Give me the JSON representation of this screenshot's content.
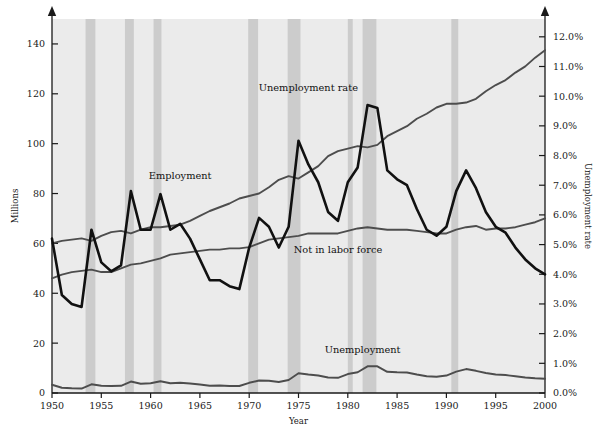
{
  "figure": {
    "xlabel": "Year",
    "ylabel_left": "Millions",
    "ylabel_right": "Unemployment rate",
    "bottom_clipped_text": ""
  },
  "series_labels": {
    "employment": "Employment",
    "not_in_labor_force": "Not in labor force",
    "unemployment": "Unemployment",
    "unemployment_rate": "Unemployment rate"
  },
  "colors": {
    "plot_background": "#ebebeb",
    "recession_band": "#cccccc",
    "axis": "#1a1a1a",
    "gray_line": "#4d4d4d",
    "black_line": "#111111",
    "page_background": "#ffffff"
  },
  "axes": {
    "x_ticks": [
      "1950",
      "1955",
      "1960",
      "1965",
      "1970",
      "1975",
      "1980",
      "1985",
      "1990",
      "1995",
      "2000"
    ],
    "y_left_ticks": [
      "0",
      "20",
      "40",
      "60",
      "80",
      "100",
      "120",
      "140"
    ],
    "y_right_ticks": [
      "0.0%",
      "1.0%",
      "2.0%",
      "3.0%",
      "4.0%",
      "5.0%",
      "6.0%",
      "7.0%",
      "8.0%",
      "9.0%",
      "10.0%",
      "11.0%",
      "12.0%"
    ]
  },
  "chart_data": {
    "type": "line",
    "title": "",
    "xlabel": "Year",
    "ylabel": "Millions",
    "ylabel_secondary": "Unemployment rate",
    "xlim": [
      1950,
      2000
    ],
    "ylim": [
      0,
      150
    ],
    "ylim_secondary": [
      0,
      12.6
    ],
    "grid": false,
    "legend": "inline-labels",
    "x": [
      1950,
      1951,
      1952,
      1953,
      1954,
      1955,
      1956,
      1957,
      1958,
      1959,
      1960,
      1961,
      1962,
      1963,
      1964,
      1965,
      1966,
      1967,
      1968,
      1969,
      1970,
      1971,
      1972,
      1973,
      1974,
      1975,
      1976,
      1977,
      1978,
      1979,
      1980,
      1981,
      1982,
      1983,
      1984,
      1985,
      1986,
      1987,
      1988,
      1989,
      1990,
      1991,
      1992,
      1993,
      1994,
      1995,
      1996,
      1997,
      1998,
      1999,
      2000
    ],
    "series": [
      {
        "name": "Employment",
        "axis": "left",
        "unit": "millions",
        "color": "#4d4d4d",
        "values": [
          60.0,
          61.0,
          61.5,
          62.0,
          61.0,
          63.0,
          64.5,
          65.0,
          64.0,
          65.5,
          66.5,
          66.5,
          67.0,
          67.5,
          69.0,
          71.0,
          73.0,
          74.5,
          76.0,
          78.0,
          79.0,
          80.0,
          82.5,
          85.5,
          87.0,
          86.0,
          88.5,
          91.0,
          95.0,
          97.0,
          98.0,
          99.0,
          98.5,
          99.5,
          103.0,
          105.0,
          107.0,
          110.0,
          112.0,
          114.5,
          116.0,
          116.0,
          116.5,
          118.0,
          121.0,
          123.5,
          125.5,
          128.5,
          131.0,
          134.5,
          137.5
        ]
      },
      {
        "name": "Not in labor force",
        "axis": "left",
        "unit": "millions",
        "color": "#4d4d4d",
        "values": [
          46.0,
          47.5,
          48.5,
          49.0,
          49.5,
          48.5,
          48.5,
          50.0,
          51.5,
          52.0,
          53.0,
          54.0,
          55.5,
          56.0,
          56.5,
          57.0,
          57.5,
          57.5,
          58.0,
          58.0,
          58.5,
          60.0,
          61.5,
          62.0,
          62.5,
          63.0,
          64.0,
          64.0,
          64.0,
          64.0,
          65.0,
          66.0,
          66.5,
          66.0,
          65.5,
          65.5,
          65.5,
          65.0,
          64.5,
          64.0,
          64.0,
          65.5,
          66.5,
          67.0,
          65.5,
          66.0,
          66.0,
          66.5,
          67.5,
          68.5,
          70.0
        ]
      },
      {
        "name": "Unemployment",
        "axis": "left",
        "unit": "millions",
        "color": "#4d4d4d",
        "values": [
          3.3,
          2.1,
          1.9,
          1.8,
          3.5,
          2.9,
          2.8,
          2.9,
          4.6,
          3.7,
          3.9,
          4.7,
          3.9,
          4.1,
          3.8,
          3.4,
          2.9,
          3.0,
          2.8,
          2.8,
          4.1,
          5.0,
          4.9,
          4.4,
          5.2,
          7.9,
          7.4,
          7.0,
          6.2,
          6.1,
          7.6,
          8.3,
          10.7,
          10.7,
          8.5,
          8.3,
          8.2,
          7.4,
          6.7,
          6.5,
          7.0,
          8.6,
          9.6,
          8.9,
          8.0,
          7.4,
          7.2,
          6.7,
          6.2,
          5.9,
          5.7
        ]
      },
      {
        "name": "Unemployment rate",
        "axis": "right",
        "unit": "percent",
        "color": "#111111",
        "values": [
          5.2,
          3.3,
          3.0,
          2.9,
          5.5,
          4.4,
          4.1,
          4.3,
          6.8,
          5.5,
          5.5,
          6.7,
          5.5,
          5.7,
          5.2,
          4.5,
          3.8,
          3.8,
          3.6,
          3.5,
          4.9,
          5.9,
          5.6,
          4.9,
          5.6,
          8.5,
          7.7,
          7.1,
          6.1,
          5.8,
          7.1,
          7.6,
          9.7,
          9.6,
          7.5,
          7.2,
          7.0,
          6.2,
          5.5,
          5.3,
          5.6,
          6.8,
          7.5,
          6.9,
          6.1,
          5.6,
          5.4,
          4.9,
          4.5,
          4.2,
          4.0
        ]
      }
    ],
    "recession_bands": [
      {
        "start": 1953.4,
        "end": 1954.4
      },
      {
        "start": 1957.4,
        "end": 1958.3
      },
      {
        "start": 1960.3,
        "end": 1961.1
      },
      {
        "start": 1969.9,
        "end": 1970.9
      },
      {
        "start": 1973.9,
        "end": 1975.2
      },
      {
        "start": 1980.0,
        "end": 1980.5
      },
      {
        "start": 1981.5,
        "end": 1982.9
      },
      {
        "start": 1990.5,
        "end": 1991.2
      }
    ],
    "annotations": [
      {
        "text": "Employment",
        "x": 1963.0,
        "y": 86.0
      },
      {
        "text": "Not in labor force",
        "x": 1979.0,
        "y": 56.0
      },
      {
        "text": "Unemployment",
        "x": 1981.5,
        "y": 16.0
      },
      {
        "text": "Unemployment rate",
        "x": 1976.0,
        "y": 121.0
      }
    ]
  }
}
